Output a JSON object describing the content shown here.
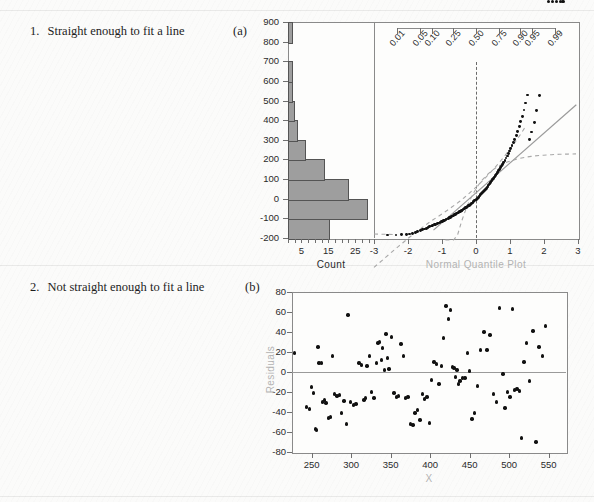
{
  "page": {
    "background": "#fbfbfa",
    "rows": [
      {
        "number": "1.",
        "caption": "Straight enough to fit a line",
        "letter": "(a)"
      },
      {
        "number": "2.",
        "caption": "Not straight enough to fit a line",
        "letter": "(b)"
      }
    ]
  },
  "chart_data": [
    {
      "id": "panel-a",
      "type": "histogram+qq",
      "title": "",
      "histogram": {
        "type": "bar",
        "orientation": "horizontal",
        "xlabel": "Count",
        "ylabel": "",
        "xlim": [
          0,
          32
        ],
        "ylim": [
          -200,
          900
        ],
        "xticks": [
          5,
          15,
          25
        ],
        "xticklabels": [
          "5",
          "15",
          "25"
        ],
        "yticks": [
          -200,
          -100,
          0,
          100,
          200,
          300,
          400,
          500,
          600,
          700,
          800,
          900
        ],
        "yticklabels": [
          "-200",
          "-100",
          "0",
          "100",
          "200",
          "300",
          "400",
          "500",
          "600",
          "700",
          "800",
          "900"
        ],
        "bin_lower": [
          -200,
          -100,
          0,
          100,
          200,
          300,
          400,
          500,
          600,
          700,
          800
        ],
        "bin_upper": [
          -100,
          0,
          100,
          200,
          300,
          400,
          500,
          600,
          700,
          800,
          900
        ],
        "counts": [
          15,
          29,
          22,
          13,
          6,
          3,
          2,
          1,
          1,
          0,
          1
        ],
        "bar_color": "#9e9e9e",
        "bar_edge": "#545454"
      },
      "qqplot": {
        "type": "scatter",
        "xlabel": "Normal Quantile Plot",
        "ylabel": "",
        "xlim": [
          -3,
          3
        ],
        "ylim": [
          -200,
          900
        ],
        "xticks": [
          -3,
          -2,
          -1,
          0,
          1,
          2,
          3
        ],
        "xticklabels": [
          "-3",
          "-2",
          "-1",
          "0",
          "1",
          "2",
          "3"
        ],
        "prob_axis_label": "",
        "prob_ticks": [
          0.01,
          0.05,
          0.1,
          0.25,
          0.5,
          0.75,
          0.9,
          0.95,
          0.99
        ],
        "prob_ticklabels": [
          "0.01",
          "0.05",
          "0.10",
          "0.25",
          "0.50",
          "0.75",
          "0.90",
          "0.95",
          "0.99"
        ],
        "reference_line": {
          "slope": 152,
          "intercept": 30,
          "color": "#9a9a9a"
        },
        "confidence_bands": {
          "style": "dashed",
          "color": "#a8a8a8"
        },
        "vertical_dashed_at_x": 0,
        "grid": false,
        "points_z": [
          -2.6,
          -2.35,
          -2.18,
          -2.05,
          -1.95,
          -1.86,
          -1.78,
          -1.71,
          -1.64,
          -1.58,
          -1.52,
          -1.46,
          -1.41,
          -1.36,
          -1.31,
          -1.27,
          -1.22,
          -1.18,
          -1.14,
          -1.1,
          -1.06,
          -1.02,
          -0.99,
          -0.95,
          -0.92,
          -0.88,
          -0.85,
          -0.82,
          -0.78,
          -0.75,
          -0.72,
          -0.69,
          -0.66,
          -0.63,
          -0.6,
          -0.57,
          -0.55,
          -0.52,
          -0.49,
          -0.46,
          -0.43,
          -0.41,
          -0.38,
          -0.35,
          -0.33,
          -0.3,
          -0.27,
          -0.25,
          -0.22,
          -0.2,
          -0.17,
          -0.14,
          -0.12,
          -0.09,
          -0.07,
          -0.04,
          -0.02,
          0.02,
          0.04,
          0.07,
          0.09,
          0.12,
          0.14,
          0.17,
          0.2,
          0.22,
          0.25,
          0.27,
          0.3,
          0.33,
          0.35,
          0.38,
          0.41,
          0.43,
          0.46,
          0.49,
          0.52,
          0.55,
          0.57,
          0.6,
          0.63,
          0.66,
          0.69,
          0.72,
          0.75,
          0.78,
          0.82,
          0.85,
          0.88,
          0.92,
          0.95,
          0.99,
          1.02,
          1.06,
          1.1,
          1.14,
          1.18,
          1.22,
          1.27,
          1.31,
          1.36,
          1.41,
          1.46,
          1.52,
          1.58,
          1.64,
          1.71,
          1.78,
          1.86,
          1.95,
          2.05
        ],
        "points_y": [
          -185,
          -185,
          -184,
          -183,
          -180,
          -176,
          -172,
          -168,
          -163,
          -158,
          -154,
          -150,
          -146,
          -142,
          -139,
          -136,
          -133,
          -130,
          -127,
          -124,
          -121,
          -118,
          -115,
          -112,
          -109,
          -106,
          -103,
          -100,
          -97,
          -94,
          -91,
          -88,
          -85,
          -82,
          -79,
          -76,
          -73,
          -70,
          -67,
          -64,
          -61,
          -58,
          -55,
          -52,
          -49,
          -46,
          -43,
          -40,
          -36,
          -33,
          -30,
          -26,
          -22,
          -18,
          -14,
          -10,
          -6,
          -2,
          3,
          8,
          13,
          18,
          23,
          28,
          33,
          38,
          43,
          48,
          54,
          60,
          66,
          72,
          78,
          84,
          90,
          97,
          104,
          111,
          118,
          126,
          134,
          142,
          150,
          158,
          167,
          176,
          186,
          196,
          207,
          218,
          230,
          243,
          256,
          270,
          286,
          303,
          322,
          343,
          366,
          392,
          420,
          452,
          488,
          528,
          300,
          340,
          390,
          450,
          525
        ],
        "points_color": "#111111"
      }
    },
    {
      "id": "panel-b",
      "type": "scatter",
      "title": "",
      "xlabel": "X",
      "ylabel": "Residuals",
      "xlim": [
        225,
        572
      ],
      "ylim": [
        -80,
        80
      ],
      "xticks": [
        250,
        300,
        350,
        400,
        450,
        500,
        550
      ],
      "xticklabels": [
        "250",
        "300",
        "350",
        "400",
        "450",
        "500",
        "550"
      ],
      "yticks": [
        -80,
        -60,
        -40,
        -20,
        0,
        20,
        40,
        60,
        80
      ],
      "yticklabels": [
        "-80",
        "-60",
        "-40",
        "-20",
        "0",
        "20",
        "40",
        "60",
        "80"
      ],
      "zero_line": true,
      "grid": false,
      "points_color": "#111111",
      "x": [
        228,
        243,
        247,
        250,
        252,
        255,
        256,
        258,
        259,
        262,
        264,
        266,
        268,
        271,
        274,
        276,
        279,
        282,
        285,
        288,
        291,
        294,
        296,
        299,
        303,
        306,
        310,
        313,
        316,
        318,
        320,
        323,
        326,
        329,
        332,
        334,
        336,
        338,
        340,
        342,
        344,
        346,
        348,
        351,
        354,
        357,
        360,
        363,
        366,
        369,
        372,
        375,
        378,
        381,
        384,
        387,
        390,
        393,
        396,
        399,
        402,
        405,
        408,
        411,
        414,
        417,
        420,
        423,
        426,
        428,
        430,
        432,
        434,
        436,
        438,
        441,
        444,
        447,
        450,
        453,
        456,
        460,
        464,
        468,
        472,
        476,
        480,
        484,
        488,
        492,
        495,
        498,
        501,
        504,
        507,
        510,
        513,
        516,
        519,
        522,
        526,
        530,
        534,
        538,
        542,
        546,
        550,
        555,
        560,
        565,
        568
      ],
      "y": [
        19,
        -35,
        -37,
        -15,
        -21,
        -57,
        -58,
        25,
        9,
        9,
        -30,
        -28,
        -31,
        -46,
        -45,
        16,
        -22,
        -24,
        -23,
        -41,
        -29,
        -52,
        57,
        -30,
        -33,
        -32,
        9,
        7,
        -28,
        -26,
        6,
        16,
        -20,
        -26,
        9,
        29,
        30,
        12,
        24,
        2,
        38,
        14,
        3,
        35,
        -21,
        -25,
        -24,
        28,
        16,
        -26,
        -25,
        -52,
        -53,
        -41,
        -38,
        -48,
        -22,
        -27,
        -25,
        -51,
        -8,
        10,
        8,
        -12,
        6,
        34,
        66,
        53,
        62,
        5,
        4,
        -5,
        2,
        -12,
        -9,
        -6,
        -6,
        19,
        1,
        -47,
        -41,
        -14,
        22,
        40,
        22,
        37,
        -22,
        -30,
        64,
        -2,
        -36,
        -20,
        -25,
        63,
        -18,
        -17,
        -19,
        -66,
        10,
        29,
        -9,
        41,
        -70,
        25,
        16,
        46
      ]
    }
  ]
}
